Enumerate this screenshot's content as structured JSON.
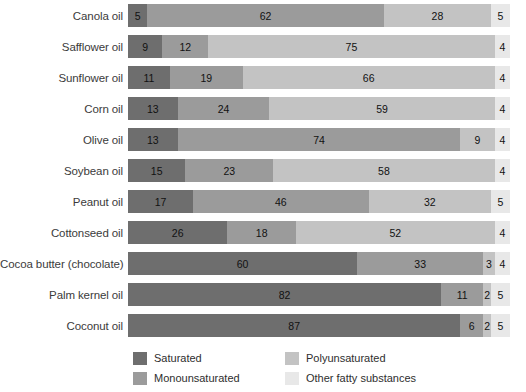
{
  "chart_data": {
    "type": "bar",
    "subtype": "stacked-horizontal-100pct",
    "title": "",
    "xlabel": "",
    "ylabel": "",
    "xlim": [
      0,
      100
    ],
    "grid": false,
    "legend_position": "bottom",
    "categories": [
      "Canola oil",
      "Safflower oil",
      "Sunflower oil",
      "Corn oil",
      "Olive oil",
      "Soybean oil",
      "Peanut oil",
      "Cottonseed oil",
      "Cocoa butter (chocolate)",
      "Palm kernel oil",
      "Coconut oil"
    ],
    "series": [
      {
        "name": "Saturated",
        "color": "#6e6e6e",
        "values": [
          5,
          9,
          11,
          13,
          13,
          15,
          17,
          26,
          60,
          82,
          87
        ]
      },
      {
        "name": "Monounsaturated",
        "color": "#9b9b9b",
        "values": [
          62,
          12,
          19,
          24,
          74,
          23,
          46,
          18,
          33,
          11,
          6
        ]
      },
      {
        "name": "Polyunsaturated",
        "color": "#c3c3c3",
        "values": [
          28,
          75,
          66,
          59,
          9,
          58,
          32,
          52,
          3,
          2,
          2
        ]
      },
      {
        "name": "Other fatty substances",
        "color": "#e8e8e8",
        "values": [
          5,
          4,
          4,
          4,
          4,
          4,
          5,
          4,
          4,
          5,
          5
        ]
      }
    ]
  },
  "legend": {
    "items": [
      {
        "label": "Saturated"
      },
      {
        "label": "Polyunsaturated"
      },
      {
        "label": "Monounsaturated"
      },
      {
        "label": "Other fatty substances"
      }
    ]
  }
}
